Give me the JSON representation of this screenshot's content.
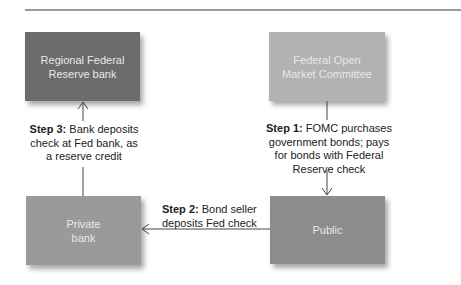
{
  "diagram": {
    "colors": {
      "regional_bank": "#6b6b6b",
      "fomc": "#b2b2b2",
      "private_bank": "#9a9a9a",
      "public": "#8c8c8c",
      "arrow": "#444444",
      "rule": "#9a9a9a"
    },
    "nodes": {
      "regional_bank": "Regional Federal\nReserve bank",
      "fomc": "Federal Open\nMarket Committee",
      "private_bank": "Private\nbank",
      "public": "Public"
    },
    "steps": [
      {
        "label": "Step 1:",
        "text": " FOMC purchases\ngovernment bonds; pays\nfor bonds with Federal\nReserve check",
        "from": "fomc",
        "to": "public"
      },
      {
        "label": "Step 2:",
        "text": " Bond seller\ndeposits Fed check",
        "from": "public",
        "to": "private_bank"
      },
      {
        "label": "Step 3:",
        "text": " Bank deposits\ncheck at Fed bank, as\na reserve credit",
        "from": "private_bank",
        "to": "regional_bank"
      }
    ]
  }
}
